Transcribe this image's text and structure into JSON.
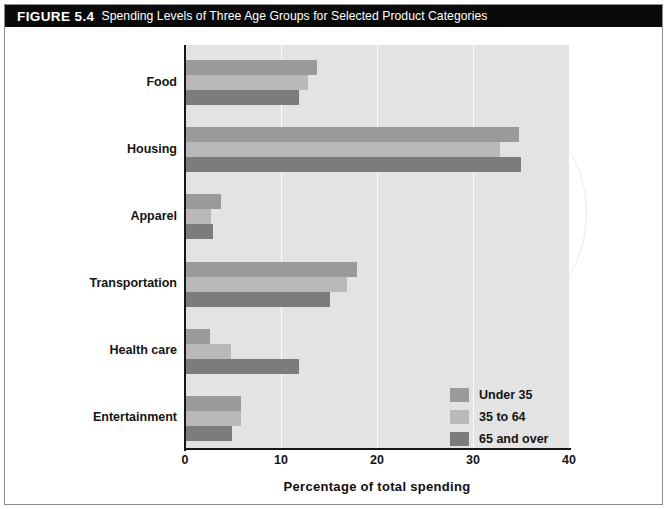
{
  "figure": {
    "number": "FIGURE 5.4",
    "title": "Spending Levels of Three Age Groups for Selected Product Categories"
  },
  "chart_data": {
    "type": "bar",
    "orientation": "horizontal",
    "title": "Spending Levels of Three Age Groups for Selected Product Categories",
    "xlabel": "Percentage of total spending",
    "ylabel": "",
    "xlim": [
      0,
      40
    ],
    "xticks": [
      "0",
      "10",
      "20",
      "30",
      "40"
    ],
    "grid": true,
    "legend_position": "inside-bottom-right",
    "categories": [
      "Food",
      "Housing",
      "Apparel",
      "Transportation",
      "Health care",
      "Entertainment"
    ],
    "series": [
      {
        "name": "Under 35",
        "color": "#9a9a9a",
        "values": [
          13.7,
          34.8,
          3.8,
          17.9,
          2.6,
          5.8
        ]
      },
      {
        "name": "35 to 64",
        "color": "#b9b9b9",
        "values": [
          12.8,
          32.8,
          2.7,
          16.9,
          4.8,
          5.8
        ]
      },
      {
        "name": "65 and over",
        "color": "#7c7c7c",
        "values": [
          11.9,
          35.0,
          2.9,
          15.1,
          11.9,
          4.9
        ]
      }
    ]
  },
  "watermark": {
    "text": "PEARSON"
  }
}
